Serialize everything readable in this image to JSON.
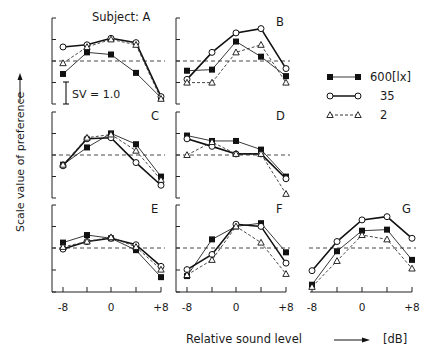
{
  "chart_data": {
    "type": "line",
    "title": "",
    "xlabel": "Relative sound level",
    "xlabel_unit": "[dB]",
    "ylabel": "Scale value of preference",
    "x": [
      -8,
      -4,
      0,
      4,
      8
    ],
    "x_tick_labels": [
      "-8",
      "0",
      "+8"
    ],
    "scale_bar_label": "SV = 1.0",
    "subject_prefix": "Subject:",
    "grid": false,
    "legend_position": "right, top",
    "legend_unit": "[lx]",
    "legend": [
      {
        "key": "600",
        "label": "600[lx]",
        "marker": "filled-square",
        "line": "solid"
      },
      {
        "key": "35",
        "label": "35",
        "marker": "open-circle",
        "line": "solid-bold"
      },
      {
        "key": "2",
        "label": "2",
        "marker": "open-triangle",
        "line": "dashed"
      }
    ],
    "panels": [
      {
        "name": "A",
        "label": "Subject: A",
        "series": [
          {
            "name": "600[lx]",
            "values": [
              -0.6,
              0.4,
              0.3,
              -0.55,
              -1.7
            ]
          },
          {
            "name": "35",
            "values": [
              0.65,
              0.75,
              1.05,
              0.85,
              -1.65
            ]
          },
          {
            "name": "2",
            "values": [
              -0.1,
              0.65,
              1.0,
              0.75,
              -1.75
            ]
          }
        ]
      },
      {
        "name": "B",
        "label": "B",
        "series": [
          {
            "name": "600[lx]",
            "values": [
              -0.45,
              -0.4,
              0.9,
              0.2,
              -0.7
            ]
          },
          {
            "name": "35",
            "values": [
              -0.85,
              0.4,
              1.3,
              1.5,
              -0.35
            ]
          },
          {
            "name": "2",
            "values": [
              -1.0,
              -1.0,
              0.4,
              0.75,
              -1.0
            ]
          }
        ]
      },
      {
        "name": "C",
        "label": "C",
        "series": [
          {
            "name": "600[lx]",
            "values": [
              -0.45,
              0.35,
              1.0,
              0.5,
              -1.0
            ]
          },
          {
            "name": "35",
            "values": [
              -0.5,
              0.75,
              0.8,
              -0.35,
              -1.4
            ]
          },
          {
            "name": "2",
            "values": [
              -0.45,
              0.8,
              0.95,
              0.2,
              -1.15
            ]
          }
        ]
      },
      {
        "name": "D",
        "label": "D",
        "series": [
          {
            "name": "600[lx]",
            "values": [
              0.9,
              0.65,
              0.65,
              0.25,
              -1.0
            ]
          },
          {
            "name": "35",
            "values": [
              0.75,
              0.4,
              0.05,
              0.05,
              -1.1
            ]
          },
          {
            "name": "2",
            "values": [
              0.0,
              0.6,
              0.05,
              0.05,
              -1.8
            ]
          }
        ]
      },
      {
        "name": "E",
        "label": "E",
        "series": [
          {
            "name": "600[lx]",
            "values": [
              0.25,
              0.6,
              0.45,
              -0.1,
              -1.35
            ]
          },
          {
            "name": "35",
            "values": [
              -0.05,
              0.3,
              0.45,
              0.15,
              -0.85
            ]
          },
          {
            "name": "2",
            "values": [
              0.05,
              0.3,
              0.5,
              0.05,
              -1.0
            ]
          }
        ]
      },
      {
        "name": "F",
        "label": "F",
        "series": [
          {
            "name": "600[lx]",
            "values": [
              -1.3,
              0.4,
              1.0,
              1.15,
              -0.2
            ]
          },
          {
            "name": "35",
            "values": [
              -1.0,
              -0.3,
              1.1,
              1.0,
              -0.7
            ]
          },
          {
            "name": "2",
            "values": [
              -1.25,
              -0.55,
              1.0,
              0.25,
              -1.2
            ]
          }
        ]
      },
      {
        "name": "G",
        "label": "G",
        "series": [
          {
            "name": "600[lx]",
            "values": [
              -1.7,
              -0.15,
              0.8,
              0.85,
              -0.55
            ]
          },
          {
            "name": "35",
            "values": [
              -1.05,
              0.3,
              1.3,
              1.45,
              0.45
            ]
          },
          {
            "name": "2",
            "values": [
              -1.8,
              -0.6,
              0.6,
              0.4,
              -0.95
            ]
          }
        ]
      }
    ],
    "ylim": [
      -2.0,
      2.0
    ]
  }
}
